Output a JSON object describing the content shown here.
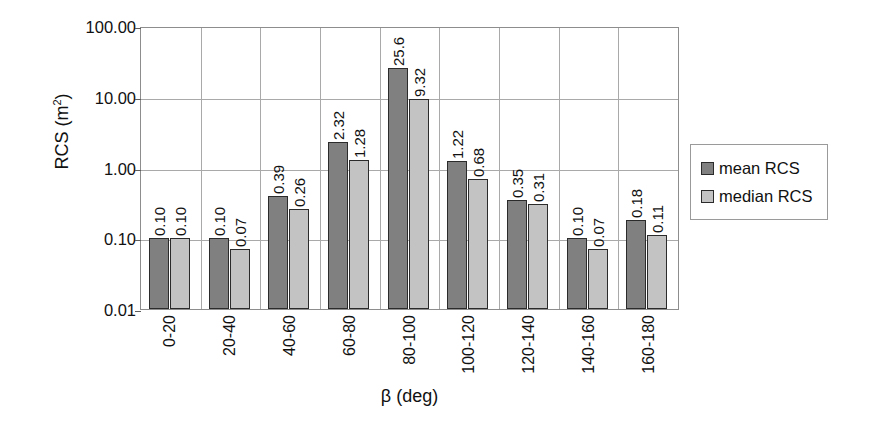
{
  "chart_data": {
    "type": "bar",
    "title": "",
    "xlabel": "β (deg)",
    "ylabel": "RCS (m²)",
    "ylabel_base": "RCS (m",
    "ylabel_sup": "2",
    "ylabel_close": ")",
    "yscale": "log",
    "ylim": [
      0.01,
      100.0
    ],
    "ytick_labels": [
      "100.00",
      "10.00",
      "1.00",
      "0.10",
      "0.01"
    ],
    "ytick_values": [
      100.0,
      10.0,
      1.0,
      0.1,
      0.01
    ],
    "grid": "horizontal-and-vertical",
    "legend_position": "right",
    "categories": [
      "0-20",
      "20-40",
      "40-60",
      "60-80",
      "80-100",
      "100-120",
      "120-140",
      "140-160",
      "160-180"
    ],
    "series": [
      {
        "name": "mean RCS",
        "color": "#808080",
        "values": [
          0.1,
          0.1,
          0.39,
          2.32,
          25.6,
          1.22,
          0.35,
          0.1,
          0.18
        ],
        "labels": [
          "0.10",
          "0.10",
          "0.39",
          "2.32",
          "25.6",
          "1.22",
          "0.35",
          "0.10",
          "0.18"
        ]
      },
      {
        "name": "median RCS",
        "color": "#c3c3c3",
        "values": [
          0.1,
          0.07,
          0.26,
          1.28,
          9.32,
          0.68,
          0.31,
          0.07,
          0.11
        ],
        "labels": [
          "0.10",
          "0.07",
          "0.26",
          "1.28",
          "9.32",
          "0.68",
          "0.31",
          "0.07",
          "0.11"
        ]
      }
    ]
  },
  "legend": {
    "items": [
      {
        "label": "mean RCS",
        "color": "#808080"
      },
      {
        "label": "median RCS",
        "color": "#c3c3c3"
      }
    ]
  }
}
